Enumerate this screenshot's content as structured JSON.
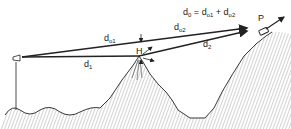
{
  "diagram": {
    "type": "knife-edge diffraction over mountain ridge",
    "labels": {
      "d01": {
        "main": "d",
        "sub": "o1"
      },
      "d02": {
        "main": "d",
        "sub": "o2"
      },
      "d1": {
        "main": "d",
        "sub": "1"
      },
      "d2": {
        "main": "d",
        "sub": "2"
      },
      "H": "H",
      "P": "P",
      "equation": {
        "lhs": "d",
        "lhs_sub": "0",
        "eq": " = ",
        "t1": "d",
        "t1_sub": "o1",
        "plus": " + ",
        "t2": "d",
        "t2_sub": "o2"
      }
    },
    "elements": [
      "transmitter-antenna",
      "receiver-vehicle",
      "mountain-ridge-terrain",
      "direct-path-line",
      "diffracted-path-lines",
      "height-arrow"
    ],
    "colors": {
      "ink": "#222222",
      "background": "#ffffff"
    }
  }
}
